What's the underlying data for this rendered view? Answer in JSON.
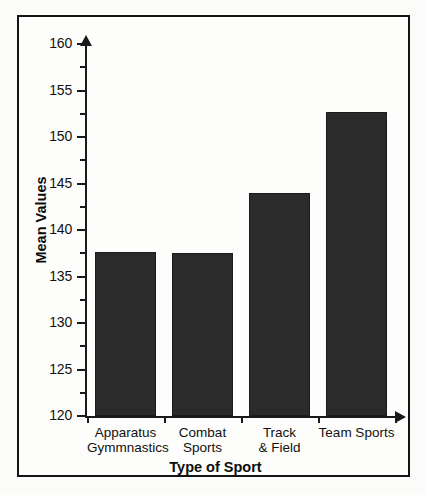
{
  "chart_data": {
    "type": "bar",
    "title": "",
    "xlabel": "Type of Sport",
    "ylabel": "Mean Values",
    "categories": [
      "Apparatus Gymmnastics",
      "Combat Sports",
      "Track & Field",
      "Team Sports"
    ],
    "category_lines": [
      [
        "Apparatus",
        "Gymmnastics"
      ],
      [
        "Combat",
        "Sports"
      ],
      [
        "Track",
        "& Field"
      ],
      [
        "Team Sports",
        ""
      ]
    ],
    "values": [
      137.6,
      137.5,
      144.0,
      152.7
    ],
    "ylim": [
      120,
      160
    ],
    "ytick_major": [
      120,
      125,
      130,
      135,
      140,
      145,
      150,
      155,
      160
    ],
    "ytick_minor": [
      122.5,
      127.5,
      132.5,
      137.5,
      142.5,
      147.5,
      152.5,
      157.5
    ],
    "ytick_labels": [
      "120",
      "125",
      "130",
      "135",
      "140",
      "145",
      "150",
      "155",
      "160"
    ],
    "grid": false,
    "legend": "none",
    "bar_color": "#2b2b2b",
    "axis_color": "#1a1a1a",
    "background_color": "#fdfdfb"
  }
}
